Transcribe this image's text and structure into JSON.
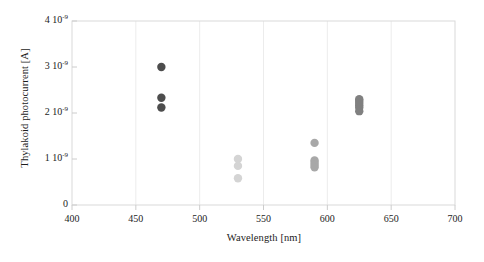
{
  "chart_data": {
    "type": "scatter",
    "title": "",
    "xlabel": "Wavelength [nm]",
    "ylabel": "Thylakoid photocurrent [A]",
    "xlim": [
      400,
      700
    ],
    "ylim": [
      0,
      4e-09
    ],
    "xticks": [
      400,
      450,
      500,
      550,
      600,
      650,
      700
    ],
    "xtick_labels": [
      "400",
      "450",
      "500",
      "550",
      "600",
      "650",
      "700"
    ],
    "yticks": [
      0,
      1e-09,
      2e-09,
      3e-09,
      4e-09
    ],
    "ytick_labels": [
      "0",
      "1 10-9",
      "2 10-9",
      "3 10-9",
      "4 10-9"
    ],
    "grid": "vertical-only",
    "legend": "none",
    "marker": "filled-circle",
    "series": [
      {
        "name": "470 nm (blue LED)",
        "color": "#4d4d4d",
        "x": [
          470,
          470,
          470
        ],
        "y": [
          3e-09,
          2.33e-09,
          2.12e-09
        ]
      },
      {
        "name": "530 nm (green LED)",
        "color": "#d4d4d4",
        "x": [
          530,
          530,
          530
        ],
        "y": [
          1e-09,
          8.5e-10,
          5.8e-10
        ]
      },
      {
        "name": "590 nm (amber LED)",
        "color": "#a8a8a8",
        "x": [
          590,
          590,
          590,
          590,
          590
        ],
        "y": [
          1.35e-09,
          9.7e-10,
          9.2e-10,
          8.7e-10,
          8.2e-10
        ]
      },
      {
        "name": "625 nm (red LED)",
        "color": "#808080",
        "x": [
          625,
          625,
          625,
          625,
          625,
          625
        ],
        "y": [
          2.3e-09,
          2.26e-09,
          2.22e-09,
          2.17e-09,
          2.12e-09,
          2.04e-09
        ]
      }
    ]
  },
  "axes": {
    "frame_color": "#d9d9d9",
    "grid_color": "#ececec",
    "tick_color": "#cccccc"
  },
  "ytick_labels_rich": [
    {
      "mantissa": "4",
      "base": "10",
      "exponent": "-9"
    },
    {
      "mantissa": "3",
      "base": "10",
      "exponent": "-9"
    },
    {
      "mantissa": "2",
      "base": "10",
      "exponent": "-9"
    },
    {
      "mantissa": "1",
      "base": "10",
      "exponent": "-9"
    },
    {
      "mantissa": "0",
      "base": "",
      "exponent": ""
    }
  ]
}
